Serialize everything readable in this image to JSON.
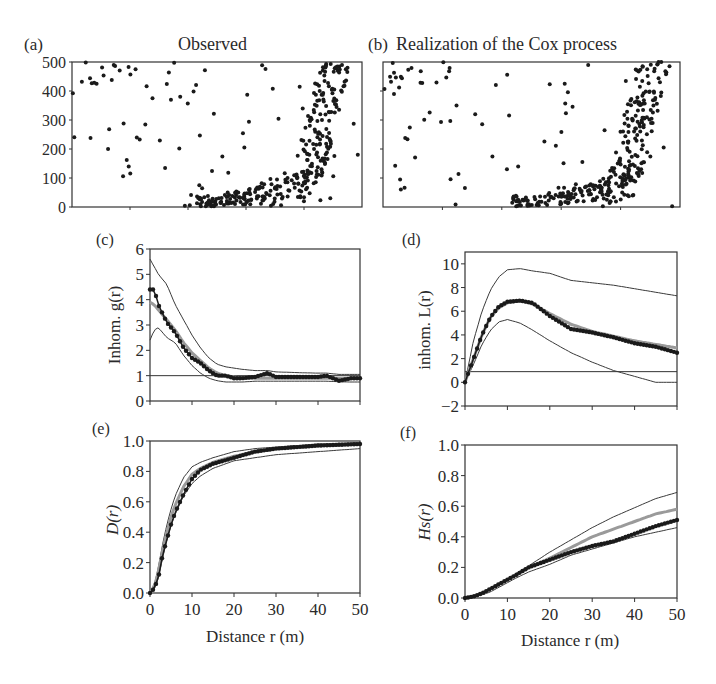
{
  "figure": {
    "panels": {
      "a": {
        "tag": "(a)",
        "title": "Observed"
      },
      "b": {
        "tag": "(b)",
        "title": "Realization of  the Cox process"
      },
      "c": {
        "tag": "(c)",
        "ylabel": "Inhom. g(r)"
      },
      "d": {
        "tag": "(d)",
        "ylabel": "inhom. L(r)"
      },
      "e": {
        "tag": "(e)",
        "ylabel": "D(r)",
        "xlabel": "Distance r (m)"
      },
      "f": {
        "tag": "(f)",
        "ylabel": "Hs(r)",
        "xlabel": "Distance r (m)"
      }
    },
    "colors": {
      "observed": "#1a1a1a",
      "envelope": "#3a3a3a",
      "model": "#9a9a9a",
      "axis": "#333333"
    }
  },
  "chart_data": [
    {
      "id": "a",
      "type": "scatter",
      "title": "Observed",
      "xlim": [
        0,
        1000
      ],
      "ylim": [
        0,
        500
      ],
      "yticks": [
        0,
        100,
        200,
        300,
        400,
        500
      ],
      "description": "Point pattern: dense cluster along bottom (x 450-800, y 0-150) curving up along the right side (x 800-1000, y 100-500); sparse points elsewhere, small cluster top-left."
    },
    {
      "id": "b",
      "type": "scatter",
      "title": "Realization of the Cox process",
      "xlim": [
        0,
        1000
      ],
      "ylim": [
        0,
        500
      ],
      "description": "Simulated Cox process realization with similar U-shaped clustered pattern at bottom and right side."
    },
    {
      "id": "c",
      "type": "line",
      "ylabel": "Inhom. g(r)",
      "xlim": [
        0,
        50
      ],
      "ylim": [
        0,
        6
      ],
      "yticks": [
        0,
        1,
        2,
        3,
        4,
        5,
        6
      ],
      "xticks": [
        0,
        10,
        20,
        30,
        40,
        50
      ],
      "reference_line": 1,
      "x": [
        0,
        1,
        2,
        4,
        6,
        8,
        10,
        12,
        14,
        16,
        18,
        20,
        22,
        25,
        28,
        30,
        35,
        40,
        42,
        45,
        48,
        50
      ],
      "series": [
        {
          "name": "observed",
          "values": [
            4.4,
            4.4,
            3.8,
            3.1,
            2.7,
            2.1,
            1.7,
            1.5,
            1.2,
            1.0,
            1.0,
            0.9,
            0.9,
            0.95,
            1.1,
            0.95,
            0.95,
            0.95,
            1.0,
            0.8,
            0.9,
            0.9
          ]
        },
        {
          "name": "model",
          "values": [
            3.9,
            3.8,
            3.6,
            3.2,
            2.8,
            2.3,
            1.9,
            1.6,
            1.3,
            1.1,
            1.0,
            0.95,
            0.92,
            0.9,
            0.9,
            0.9,
            0.9,
            0.9,
            0.9,
            0.9,
            0.9,
            0.9
          ]
        },
        {
          "name": "upper",
          "values": [
            5.6,
            5.3,
            5.0,
            4.6,
            3.8,
            3.2,
            2.6,
            2.1,
            1.7,
            1.45,
            1.35,
            1.3,
            1.25,
            1.2,
            1.2,
            1.15,
            1.12,
            1.1,
            1.1,
            1.05,
            1.05,
            1.05
          ]
        },
        {
          "name": "lower",
          "values": [
            2.4,
            2.8,
            2.9,
            2.5,
            2.3,
            1.8,
            1.4,
            1.1,
            0.9,
            0.8,
            0.75,
            0.75,
            0.75,
            0.78,
            0.78,
            0.78,
            0.78,
            0.78,
            0.78,
            0.76,
            0.75,
            0.75
          ]
        }
      ]
    },
    {
      "id": "d",
      "type": "line",
      "ylabel": "inhom. L(r)",
      "xlim": [
        0,
        50
      ],
      "ylim": [
        -2,
        11
      ],
      "yticks": [
        -2,
        0,
        2,
        4,
        6,
        8,
        10
      ],
      "xticks": [
        0,
        10,
        20,
        30,
        40,
        50
      ],
      "reference_line": 0.9,
      "x": [
        0,
        2,
        4,
        6,
        8,
        10,
        13,
        16,
        20,
        25,
        30,
        35,
        40,
        45,
        50
      ],
      "series": [
        {
          "name": "observed",
          "values": [
            0,
            2.0,
            4.0,
            5.5,
            6.4,
            6.8,
            6.9,
            6.7,
            5.6,
            4.5,
            4.2,
            3.8,
            3.3,
            3.0,
            2.5
          ]
        },
        {
          "name": "model",
          "values": [
            0,
            2.0,
            4.0,
            5.5,
            6.3,
            6.7,
            6.9,
            6.6,
            5.8,
            4.9,
            4.3,
            3.9,
            3.5,
            3.2,
            2.9
          ]
        },
        {
          "name": "upper",
          "values": [
            0,
            3.5,
            6.0,
            7.8,
            8.9,
            9.5,
            9.6,
            9.4,
            9.2,
            8.6,
            8.4,
            8.2,
            7.9,
            7.6,
            7.3
          ]
        },
        {
          "name": "lower",
          "values": [
            0,
            1.5,
            3.2,
            4.4,
            5.1,
            5.3,
            5.0,
            4.4,
            3.5,
            2.5,
            1.7,
            1.0,
            0.5,
            0.0,
            0.0
          ]
        }
      ]
    },
    {
      "id": "e",
      "type": "line",
      "ylabel": "D(r)",
      "xlabel": "Distance r (m)",
      "xlim": [
        0,
        50
      ],
      "ylim": [
        0,
        1
      ],
      "yticks": [
        "0.0",
        "0.2",
        "0.4",
        "0.6",
        "0.8",
        "1.0"
      ],
      "xticks": [
        0,
        10,
        20,
        30,
        40,
        50
      ],
      "x": [
        0,
        1,
        2,
        3,
        4,
        5,
        6,
        8,
        10,
        12,
        15,
        20,
        25,
        30,
        40,
        50
      ],
      "series": [
        {
          "name": "observed",
          "values": [
            0,
            0.03,
            0.1,
            0.25,
            0.35,
            0.45,
            0.53,
            0.65,
            0.75,
            0.81,
            0.85,
            0.89,
            0.93,
            0.95,
            0.97,
            0.98
          ]
        },
        {
          "name": "model",
          "values": [
            0,
            0.04,
            0.14,
            0.28,
            0.4,
            0.5,
            0.58,
            0.7,
            0.78,
            0.82,
            0.86,
            0.9,
            0.93,
            0.95,
            0.97,
            0.98
          ]
        },
        {
          "name": "upper",
          "values": [
            0,
            0.05,
            0.17,
            0.32,
            0.45,
            0.55,
            0.64,
            0.76,
            0.83,
            0.86,
            0.89,
            0.93,
            0.95,
            0.96,
            0.98,
            0.99
          ]
        },
        {
          "name": "lower",
          "values": [
            0,
            0.02,
            0.1,
            0.23,
            0.35,
            0.44,
            0.52,
            0.64,
            0.72,
            0.77,
            0.82,
            0.87,
            0.89,
            0.91,
            0.93,
            0.95
          ]
        }
      ]
    },
    {
      "id": "f",
      "type": "line",
      "ylabel": "Hs(r)",
      "xlabel": "Distance r (m)",
      "xlim": [
        0,
        50
      ],
      "ylim": [
        0,
        1
      ],
      "yticks": [
        "0.0",
        "0.2",
        "0.4",
        "0.6",
        "0.8",
        "1.0"
      ],
      "xticks": [
        0,
        10,
        20,
        30,
        40,
        50
      ],
      "x": [
        0,
        2,
        4,
        6,
        8,
        10,
        12,
        15,
        20,
        25,
        30,
        35,
        40,
        45,
        50
      ],
      "series": [
        {
          "name": "observed",
          "values": [
            0,
            0.01,
            0.03,
            0.06,
            0.09,
            0.12,
            0.15,
            0.2,
            0.25,
            0.3,
            0.34,
            0.37,
            0.42,
            0.47,
            0.51
          ]
        },
        {
          "name": "model",
          "values": [
            0,
            0.01,
            0.03,
            0.06,
            0.09,
            0.12,
            0.15,
            0.2,
            0.26,
            0.33,
            0.4,
            0.45,
            0.5,
            0.55,
            0.58
          ]
        },
        {
          "name": "upper",
          "values": [
            0,
            0.01,
            0.03,
            0.06,
            0.09,
            0.12,
            0.16,
            0.21,
            0.3,
            0.38,
            0.46,
            0.53,
            0.59,
            0.65,
            0.69
          ]
        },
        {
          "name": "lower",
          "values": [
            0,
            0.01,
            0.02,
            0.04,
            0.07,
            0.1,
            0.13,
            0.17,
            0.22,
            0.28,
            0.32,
            0.36,
            0.4,
            0.43,
            0.46
          ]
        }
      ]
    }
  ]
}
